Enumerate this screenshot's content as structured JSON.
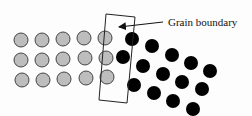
{
  "diagram": {
    "label": "Grain boundary",
    "label_pos": {
      "x": 168,
      "y": 26
    },
    "colors": {
      "grain_a_fill": "#bdbdbd",
      "grain_a_stroke": "#444444",
      "grain_b_fill": "#000000",
      "boundary_stroke": "#222222",
      "background": "#fdfdfd"
    },
    "atom_radius": 7,
    "grain_a_atoms": [
      {
        "x": 21,
        "y": 40
      },
      {
        "x": 42,
        "y": 40
      },
      {
        "x": 63,
        "y": 39
      },
      {
        "x": 84,
        "y": 38
      },
      {
        "x": 105,
        "y": 38
      },
      {
        "x": 21,
        "y": 60
      },
      {
        "x": 42,
        "y": 60
      },
      {
        "x": 63,
        "y": 59
      },
      {
        "x": 85,
        "y": 58
      },
      {
        "x": 106,
        "y": 58
      },
      {
        "x": 22,
        "y": 80
      },
      {
        "x": 43,
        "y": 80
      },
      {
        "x": 64,
        "y": 79
      },
      {
        "x": 86,
        "y": 78
      },
      {
        "x": 107,
        "y": 77
      }
    ],
    "grain_b_atoms": [
      {
        "x": 132,
        "y": 39
      },
      {
        "x": 152,
        "y": 46
      },
      {
        "x": 172,
        "y": 55
      },
      {
        "x": 191,
        "y": 63
      },
      {
        "x": 210,
        "y": 71
      },
      {
        "x": 123,
        "y": 57
      },
      {
        "x": 143,
        "y": 66
      },
      {
        "x": 163,
        "y": 74
      },
      {
        "x": 182,
        "y": 82
      },
      {
        "x": 202,
        "y": 89
      },
      {
        "x": 134,
        "y": 85
      },
      {
        "x": 154,
        "y": 93
      },
      {
        "x": 173,
        "y": 101
      },
      {
        "x": 193,
        "y": 109
      }
    ],
    "boundary_box": [
      {
        "x": 106,
        "y": 14
      },
      {
        "x": 135,
        "y": 17
      },
      {
        "x": 127,
        "y": 103
      },
      {
        "x": 99,
        "y": 100
      }
    ],
    "arrow": {
      "from": {
        "x": 163,
        "y": 22
      },
      "to": {
        "x": 119,
        "y": 27
      }
    }
  }
}
